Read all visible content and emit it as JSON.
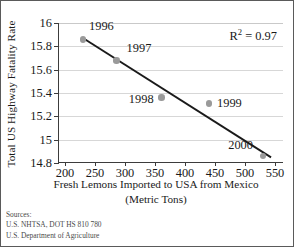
{
  "chart_data": {
    "type": "scatter",
    "title": "",
    "xlabel": "Fresh Lemons Imported to USA from Mexico (Metric Tons)",
    "xlabel_line1": "Fresh Lemons Imported to USA from Mexico",
    "xlabel_line2": "(Metric Tons)",
    "ylabel": "Total US Highway Fatality Rate",
    "xlim": [
      190,
      565
    ],
    "ylim": [
      14.8,
      16.0
    ],
    "xticks": [
      200,
      250,
      300,
      350,
      400,
      450,
      500,
      550
    ],
    "xtick_labels": [
      "200",
      "250",
      "300",
      "350",
      "400",
      "450",
      "500",
      "550"
    ],
    "yticks": [
      14.8,
      15.0,
      15.2,
      15.4,
      15.6,
      15.8,
      16.0
    ],
    "ytick_labels": [
      "14.8",
      "15",
      "15.2",
      "15.4",
      "15.6",
      "15.8",
      "16"
    ],
    "grid": true,
    "grid_axis": "y",
    "legend": "none",
    "marker_color": "#9a9a9a",
    "trendline_color": "#1a1a1a",
    "annotation_r2_prefix": "R",
    "annotation_r2_exponent": "2",
    "annotation_r2_value": "= 0.97",
    "annotation_r2_text": "R2 = 0.97",
    "points": [
      {
        "label": "1996",
        "x": 230,
        "y": 15.86,
        "label_dx": 6,
        "label_dy": -13,
        "label_align": "left"
      },
      {
        "label": "1997",
        "x": 286,
        "y": 15.68,
        "label_dx": 10,
        "label_dy": -12,
        "label_align": "left"
      },
      {
        "label": "1998",
        "x": 361,
        "y": 15.36,
        "label_dx": -8,
        "label_dy": 1,
        "label_align": "right"
      },
      {
        "label": "1999",
        "x": 440,
        "y": 15.31,
        "label_dx": 8,
        "label_dy": -1,
        "label_align": "left"
      },
      {
        "label": "2000",
        "x": 530,
        "y": 14.86,
        "label_dx": -10,
        "label_dy": -11,
        "label_align": "right"
      }
    ],
    "trendline": {
      "x0": 230,
      "y0": 15.87,
      "x1": 545,
      "y1": 14.84
    }
  },
  "sources": {
    "heading": "Sources:",
    "lines": [
      "U.S. NHTSA, DOT HS 810 780",
      "U.S. Department of Agriculture"
    ]
  }
}
